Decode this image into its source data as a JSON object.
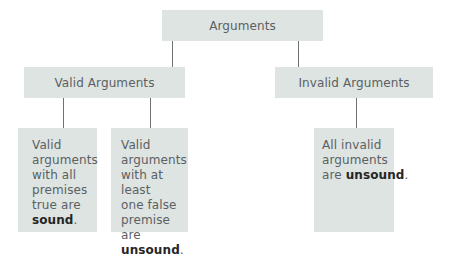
{
  "diagram": {
    "type": "tree",
    "root": {
      "label": "Arguments"
    },
    "branches": [
      {
        "label": "Valid Arguments",
        "children": [
          {
            "text": "Valid arguments with all premises true are",
            "emphasis": "sound",
            "suffix": ".",
            "lines": [
              "Valid",
              "arguments",
              "with all",
              "premises",
              "true are"
            ]
          },
          {
            "text": "Valid arguments with at least one false premise are",
            "emphasis": "unsound",
            "suffix": ".",
            "lines": [
              "Valid",
              "arguments",
              "with at least",
              "one false",
              "premise are"
            ]
          }
        ]
      },
      {
        "label": "Invalid Arguments",
        "children": [
          {
            "text": "All invalid arguments are",
            "emphasis": "unsound",
            "suffix": ".",
            "lines": [
              "All invalid",
              "arguments"
            ],
            "inline_prefix": "are "
          }
        ]
      }
    ]
  },
  "colors": {
    "box_fill": "#dee4e2",
    "text": "#5b6163",
    "emphasis_text": "#262626",
    "connector": "#6f7273"
  }
}
